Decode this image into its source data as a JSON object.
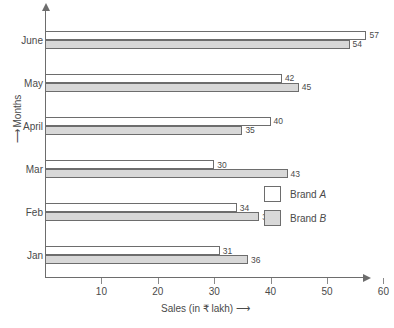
{
  "chart_data": {
    "type": "bar",
    "orientation": "horizontal",
    "title": "",
    "xlabel": "Sales (in ₹ lakh)",
    "ylabel": "Months",
    "xlabel_arrow": "⟶",
    "ylabel_arrow": "⟶",
    "categories": [
      "Jan",
      "Feb",
      "Mar",
      "April",
      "May",
      "June"
    ],
    "series": [
      {
        "name": "Brand A",
        "name_prefix": "Brand ",
        "name_emphasis": "A",
        "values": [
          31,
          34,
          30,
          40,
          42,
          57
        ],
        "color": "#ffffff"
      },
      {
        "name": "Brand B",
        "name_prefix": "Brand ",
        "name_emphasis": "B",
        "values": [
          36,
          38,
          43,
          35,
          45,
          54
        ],
        "color": "#d8d8d8"
      }
    ],
    "xlim": [
      0,
      63
    ],
    "xticks": [
      10,
      20,
      30,
      40,
      50,
      60
    ],
    "xtick_labels": [
      "10",
      "20",
      "30",
      "40",
      "50",
      "60"
    ],
    "grid": false,
    "legend_position": "middle-right"
  },
  "legend": {
    "items": [
      {
        "label": "Brand A",
        "prefix": "Brand ",
        "emphasis": "A"
      },
      {
        "label": "Brand B",
        "prefix": "Brand ",
        "emphasis": "B"
      }
    ]
  }
}
